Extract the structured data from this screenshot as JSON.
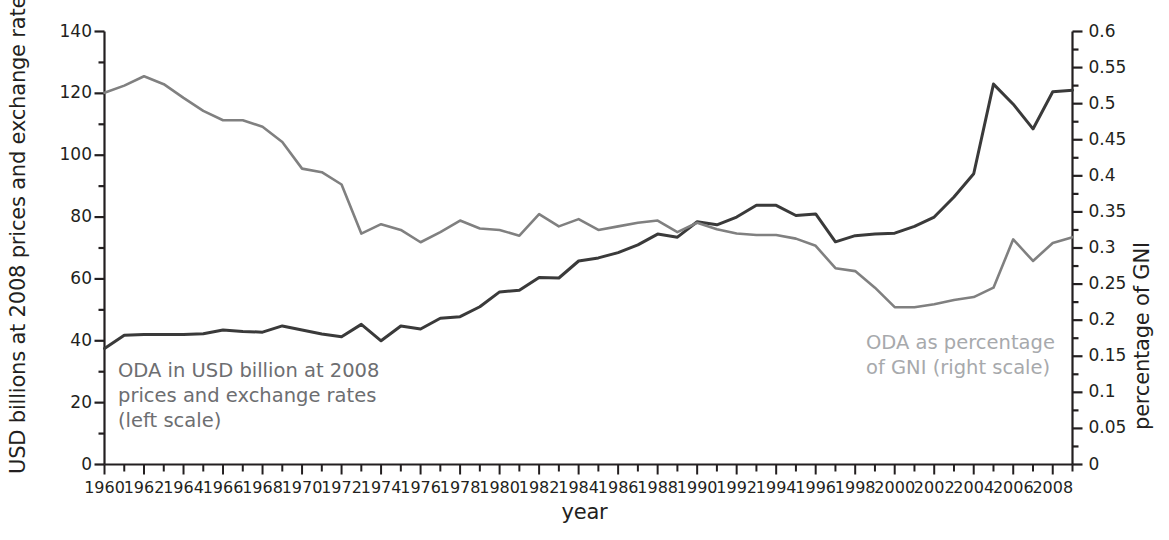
{
  "chart_data": {
    "type": "line",
    "title": "",
    "xlabel": "year",
    "ylabel_left": "USD billions at 2008 prices and exchange rates",
    "ylabel_right": "percentage of GNI",
    "xlim": [
      1960,
      2009
    ],
    "ylim_left": [
      0,
      140
    ],
    "ylim_right": [
      0,
      0.6
    ],
    "ytick_left_step": 20,
    "ytick_right_step": 0.05,
    "xtick_step": 2,
    "grid": false,
    "legend_position": "inline-annotations",
    "x": [
      1960,
      1961,
      1962,
      1963,
      1964,
      1965,
      1966,
      1967,
      1968,
      1969,
      1970,
      1971,
      1972,
      1973,
      1974,
      1975,
      1976,
      1977,
      1978,
      1979,
      1980,
      1981,
      1982,
      1983,
      1984,
      1985,
      1986,
      1987,
      1988,
      1989,
      1990,
      1991,
      1992,
      1993,
      1994,
      1995,
      1996,
      1997,
      1998,
      1999,
      2000,
      2001,
      2002,
      2003,
      2004,
      2005,
      2006,
      2007,
      2008,
      2009
    ],
    "xtick_labels": [
      "1960",
      "1962",
      "1964",
      "1966",
      "1968",
      "1970",
      "1972",
      "1974",
      "1976",
      "1978",
      "1980",
      "1982",
      "1984",
      "1986",
      "1988",
      "1990",
      "1992",
      "1994",
      "1996",
      "1998",
      "2000",
      "2002",
      "2004",
      "2006",
      "2008"
    ],
    "ytick_left_labels": [
      "0",
      "20",
      "40",
      "60",
      "80",
      "100",
      "120",
      "140"
    ],
    "ytick_right_labels": [
      "0",
      "0.05",
      "0.1",
      "0.15",
      "0.2",
      "0.25",
      "0.3",
      "0.35",
      "0.4",
      "0.45",
      "0.5",
      "0.55",
      "0.6"
    ],
    "series": [
      {
        "name": "ODA in USD billion at 2008 prices and exchange rates (left scale)",
        "axis": "left",
        "color": "#3a3a3a",
        "unit": "USD billion (2008 prices)",
        "values": [
          37.5,
          41.8,
          42.0,
          42.0,
          42.0,
          42.3,
          43.5,
          43.0,
          42.8,
          44.8,
          43.5,
          42.2,
          41.3,
          45.3,
          40.0,
          44.8,
          43.8,
          47.3,
          47.8,
          51.0,
          55.8,
          56.3,
          60.5,
          60.3,
          65.8,
          66.8,
          68.5,
          71.0,
          74.5,
          73.5,
          78.5,
          77.5,
          80.0,
          83.8,
          83.8,
          80.5,
          81.0,
          72.0,
          74.0,
          74.5,
          74.8,
          77.0,
          80.0,
          86.5,
          94.0,
          123.0,
          116.5,
          108.5,
          120.5,
          121.0
        ]
      },
      {
        "name": "ODA as percentage of GNI (right scale)",
        "axis": "right",
        "color": "#808080",
        "unit": "% of GNI",
        "values": [
          0.515,
          0.525,
          0.538,
          0.527,
          0.508,
          0.49,
          0.477,
          0.477,
          0.468,
          0.447,
          0.41,
          0.405,
          0.388,
          0.32,
          0.333,
          0.325,
          0.308,
          0.322,
          0.338,
          0.327,
          0.325,
          0.317,
          0.347,
          0.33,
          0.34,
          0.325,
          0.33,
          0.335,
          0.338,
          0.322,
          0.335,
          0.326,
          0.32,
          0.318,
          0.318,
          0.313,
          0.303,
          0.272,
          0.268,
          0.245,
          0.218,
          0.218,
          0.222,
          0.228,
          0.232,
          0.245,
          0.312,
          0.282,
          0.307,
          0.315
        ]
      }
    ],
    "annotations": [
      {
        "id": "left-annotation",
        "text": "ODA in USD billion at 2008\nprices and exchange rates\n(left scale)",
        "color": "#6d6e71"
      },
      {
        "id": "right-annotation",
        "text": "ODA as percentage\nof GNI (right scale)",
        "color": "#a7a9ac"
      }
    ]
  },
  "axes": {
    "x_title": "year",
    "y_left_title": "USD billions at 2008 prices and exchange rates",
    "y_right_title": "percentage of GNI"
  }
}
